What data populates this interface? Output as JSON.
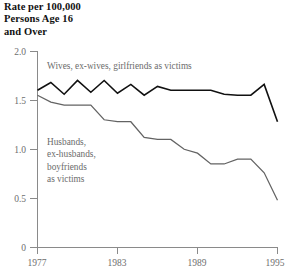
{
  "chart_data": {
    "type": "line",
    "title": "Rate per 100,000 Persons Age 16 and Over",
    "title_lines": "Rate per 100,000\nPersons Age 16\nand Over",
    "xlabel": "",
    "ylabel": "Rate per 100,000 Persons Age 16 and Over",
    "xlim": [
      1977,
      1995
    ],
    "ylim": [
      0,
      2.0
    ],
    "grid": false,
    "legend_position": "inline-annotation",
    "x_tick_labels": [
      "1977",
      "1983",
      "1989",
      "1995"
    ],
    "x_ticks": [
      1977,
      1983,
      1989,
      1995
    ],
    "y_tick_labels": [
      "0",
      "0.5",
      "1.0",
      "1.5",
      "2.0"
    ],
    "y_ticks": [
      0,
      0.5,
      1.0,
      1.5,
      2.0
    ],
    "x": [
      1977,
      1978,
      1979,
      1980,
      1981,
      1982,
      1983,
      1984,
      1985,
      1986,
      1987,
      1988,
      1989,
      1990,
      1991,
      1992,
      1993,
      1994,
      1995
    ],
    "series": [
      {
        "name": "Wives, ex-wives, girlfriends as victims",
        "color": "#111111",
        "values": [
          1.6,
          1.68,
          1.56,
          1.7,
          1.58,
          1.7,
          1.57,
          1.66,
          1.55,
          1.64,
          1.6,
          1.6,
          1.6,
          1.6,
          1.56,
          1.55,
          1.55,
          1.66,
          1.28
        ]
      },
      {
        "name": "Husbands, ex-husbands, boyfriends as victims",
        "color": "#636363",
        "values": [
          1.55,
          1.48,
          1.45,
          1.45,
          1.45,
          1.3,
          1.28,
          1.28,
          1.12,
          1.1,
          1.1,
          1.0,
          0.96,
          0.85,
          0.85,
          0.9,
          0.9,
          0.76,
          0.48
        ]
      }
    ],
    "annotations": [
      {
        "name": "upper-series-label",
        "text": "Wives, ex-wives, girlfriends as victims",
        "x": 1977.4,
        "y": 1.83
      },
      {
        "name": "lower-series-label",
        "text_lines": [
          "Husbands,",
          "ex-husbands,",
          "boyfriends",
          "as victims"
        ],
        "x": 1977.4,
        "y": 1.05
      }
    ],
    "colors": {
      "upper_series": "#111111",
      "lower_series": "#636363",
      "axis": "#8a8a8a",
      "tick_text": "#6e6e6e",
      "annotation_text": "#6b6b6b",
      "background": "#ffffff"
    }
  }
}
